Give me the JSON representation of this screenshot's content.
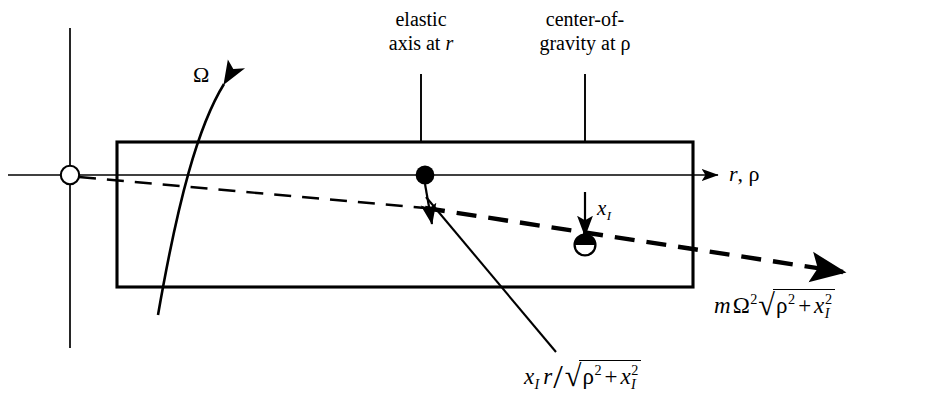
{
  "figure": {
    "background_color": "#ffffff",
    "line_color": "#000000",
    "width": 930,
    "height": 406
  },
  "labels": {
    "elastic_axis_line1": "elastic",
    "elastic_axis_line2_text": "axis at ",
    "elastic_axis_line2_symbol": "r",
    "cg_line1": "center-of-",
    "cg_line2_text": "gravity at ",
    "cg_line2_symbol": "ρ",
    "omega": "Ω",
    "axis_label_r": "r",
    "axis_label_comma": ",",
    "axis_label_rho": "ρ",
    "offset_label": "x",
    "offset_label_sub": "I"
  },
  "formulas": {
    "force": {
      "mass": "m",
      "omega": "Ω",
      "omega_exponent": "2",
      "sqrt_symbol": "√",
      "rho": "ρ",
      "rho_exponent": "2",
      "plus": "+",
      "x": "x",
      "x_sub": "I",
      "x_exponent": "2",
      "plain": "mΩ²√(ρ² + x₁²)"
    },
    "moment_arm": {
      "x": "x",
      "x_sub": "I",
      "r": "r",
      "divide": "/",
      "sqrt_symbol": "√",
      "rho": "ρ",
      "rho_exponent": "2",
      "plus": "+",
      "x2": "x",
      "x2_sub": "I",
      "x2_exponent": "2",
      "plain": "x₁ r / √(ρ² + x₁²)"
    }
  },
  "markers": {
    "origin_marker": "open-circle",
    "elastic_axis_marker": "filled-circle",
    "center_of_gravity_marker": "quartered-circle"
  }
}
